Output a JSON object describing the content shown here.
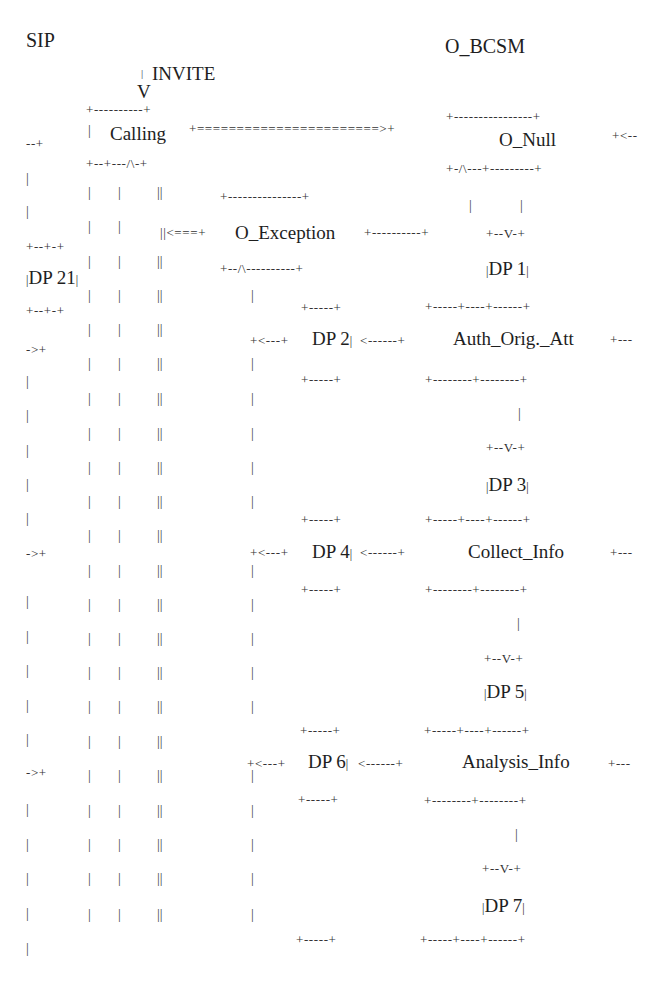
{
  "titles": {
    "sip": "SIP",
    "o_bcsm": "O_BCSM"
  },
  "sip_side": {
    "invite_label": "INVITE",
    "invite_arrow": "V",
    "calling_state": "Calling",
    "dp21": "DP 21"
  },
  "bcsm_states": {
    "o_null": "O_Null",
    "o_exception": "O_Exception",
    "auth_orig_att": "Auth_Orig._Att",
    "collect_info": "Collect_Info",
    "analysis_info": "Analysis_Info"
  },
  "detection_points": {
    "dp1": "DP 1",
    "dp2": "DP 2",
    "dp3": "DP 3",
    "dp4": "DP 4",
    "dp5": "DP 5",
    "dp6": "DP 6",
    "dp7": "DP 7"
  },
  "ascii": {
    "calling_top": "+----------+",
    "calling_link": "+=======================>+",
    "calling_bottom": "+--+---/\\-+",
    "onull_top": "+----------------+",
    "onull_back": "+<--",
    "onull_bottom": "+-/\\---+---------+",
    "exc_top": "+---------------+",
    "exc_in": "||<===+",
    "exc_out": "+----------+",
    "exc_bottom": "+--/\\----------+",
    "dp_top_v": "+--V-+",
    "small_box": "+-----+",
    "dp_back_arrow": "+<---+",
    "dp_in_arrow": "<------+",
    "auth_top": "+-----+----+------+",
    "auth_bottom": "+--------+--------+",
    "right_tail": "+---",
    "left_top": "--+",
    "dp21_box": "+--+-+",
    "left_arrow": "->+",
    "pipe": "|",
    "pipes2": "||"
  }
}
